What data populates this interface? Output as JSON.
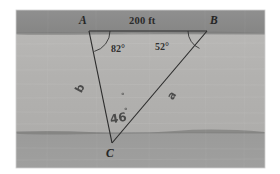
{
  "figure": {
    "caption_present": false,
    "background_color": "#ffffff",
    "panel": {
      "x": 16,
      "y": 10,
      "width": 249,
      "height": 158,
      "bands": [
        {
          "name": "upper-dark-band",
          "color": "#8d8d8d",
          "y": 10,
          "height": 22
        },
        {
          "name": "middle-light-band",
          "color": "#b4b3b1",
          "y": 32,
          "height": 100
        },
        {
          "name": "lower-dark-band",
          "color": "#9a9a99",
          "y": 132,
          "height": 36
        }
      ]
    },
    "vertices": {
      "A": {
        "label": "A",
        "x": 89,
        "y": 31,
        "label_x": 79,
        "label_y": 15
      },
      "B": {
        "label": "B",
        "x": 207,
        "y": 31,
        "label_x": 210,
        "label_y": 15
      },
      "C": {
        "label": "C",
        "x": 112,
        "y": 143,
        "label_x": 106,
        "label_y": 148
      }
    },
    "side_labels": {
      "AB": "200 ft",
      "AC": "b",
      "BC": "a",
      "C_hand": "46",
      "C_hand_degree": "°",
      "extra_hand_mark": "°"
    },
    "angles": {
      "A": "82°",
      "B": "52°"
    },
    "stroke_color": "#2c2c2c"
  }
}
